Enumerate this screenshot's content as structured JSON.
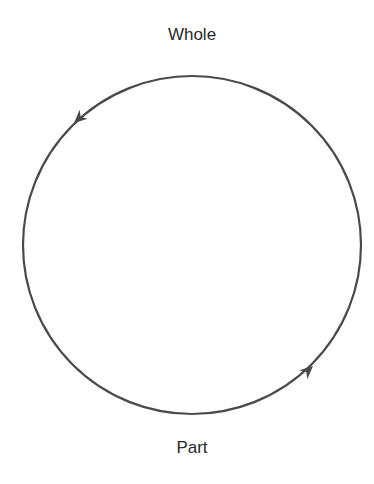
{
  "diagram": {
    "type": "cycle",
    "top_label": "Whole",
    "bottom_label": "Part",
    "colors": {
      "stroke": "#4a4a4a",
      "text": "#2a2a2a",
      "background": "#ffffff"
    },
    "arrows": [
      {
        "position": "upper-left",
        "direction": "counter-clockwise",
        "from": "Whole",
        "to": "Part"
      },
      {
        "position": "lower-right",
        "direction": "counter-clockwise",
        "from": "Part",
        "to": "Whole"
      }
    ]
  }
}
